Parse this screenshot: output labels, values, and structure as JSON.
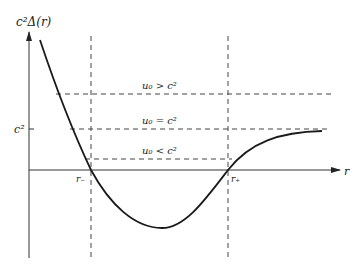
{
  "diagram": {
    "y_axis_label": "c²Δ(r)",
    "x_axis_label": "r",
    "y_tick_label": "c²",
    "r_minus_label": "r₋",
    "r_plus_label": "r₊",
    "levels": [
      {
        "label": "u₀ > c²"
      },
      {
        "label": "u₀ = c²"
      },
      {
        "label": "u₀ < c²"
      }
    ],
    "colors": {
      "curve": "#1a1a1a",
      "axes": "#333333",
      "dashed": "#444444"
    }
  }
}
